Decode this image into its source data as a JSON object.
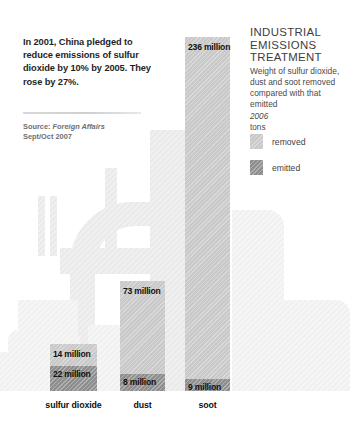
{
  "callout": {
    "text": "In 2001, China pledged to reduce emissions of sulfur dioxide by 10% by 2005. They rose by 27%.",
    "source_label": "Source:",
    "source_name": "Foreign Affairs",
    "source_date": "Sept/Oct 2007"
  },
  "title": {
    "line1": "INDUSTRIAL",
    "line2": "EMISSIONS",
    "line3": "TREATMENT",
    "subtitle": "Weight of sulfur dioxide, dust and soot removed compared with that emitted",
    "year": "2006",
    "units": "tons"
  },
  "legend": {
    "items": [
      {
        "label": "removed",
        "color": "#c9c9c9"
      },
      {
        "label": "emitted",
        "color": "#8e8e8e"
      }
    ]
  },
  "chart_data": {
    "type": "bar",
    "title": "INDUSTRIAL EMISSIONS TREATMENT",
    "subtitle": "Weight of sulfur dioxide, dust and soot removed compared with that emitted",
    "year": "2006",
    "units": "tons",
    "xlabel": "",
    "ylabel": "millions of tons",
    "ylim": [
      0,
      258
    ],
    "grid": false,
    "legend_position": "top-right",
    "stacked": true,
    "categories": [
      "sulfur dioxide",
      "dust",
      "soot"
    ],
    "series": [
      {
        "name": "removed",
        "color": "#c9c9c9",
        "values": [
          14,
          73,
          236
        ],
        "labels": [
          "14 million",
          "73 million",
          "236 million"
        ]
      },
      {
        "name": "emitted",
        "color": "#8e8e8e",
        "values": [
          22,
          8,
          9
        ],
        "labels": [
          "22 million",
          "8 million",
          "9 million"
        ]
      }
    ]
  },
  "bars": [
    {
      "category": "sulfur dioxide",
      "removed_label": "14 million",
      "emitted_label": "22 million",
      "left": 50,
      "width": 47,
      "removed_top": 344,
      "removed_height": 22,
      "emitted_top": 366,
      "emitted_height": 25
    },
    {
      "category": "dust",
      "removed_label": "73 million",
      "emitted_label": "8 million",
      "left": 120,
      "width": 45,
      "removed_top": 281,
      "removed_height": 93,
      "emitted_top": 374,
      "emitted_height": 17
    },
    {
      "category": "soot",
      "removed_label": "236 million",
      "emitted_label": "9 million",
      "left": 185,
      "width": 45,
      "removed_top": 37,
      "removed_height": 342,
      "emitted_top": 379,
      "emitted_height": 12
    }
  ],
  "baseline_y": 391,
  "category_label_y": 400
}
